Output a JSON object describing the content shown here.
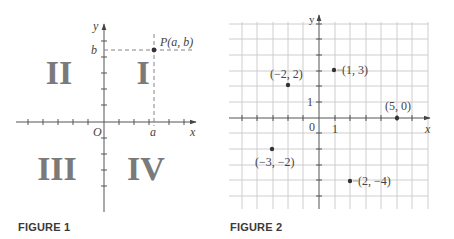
{
  "figures": [
    {
      "caption": "FIGURE 1",
      "axes": {
        "x_label": "x",
        "y_label": "y",
        "origin_label": "O"
      },
      "quadrants": [
        {
          "label": "I"
        },
        {
          "label": "II"
        },
        {
          "label": "III"
        },
        {
          "label": "IV"
        }
      ],
      "point": {
        "label": "P(a, b)",
        "x_label": "a",
        "y_label": "b"
      }
    },
    {
      "caption": "FIGURE 2",
      "axes": {
        "x_label": "x",
        "y_label": "y",
        "origin_label": "0",
        "unit_x_label": "1",
        "unit_y_label": "1"
      },
      "points": [
        {
          "label": "(1, 3)",
          "x": 1,
          "y": 3
        },
        {
          "label": "(−2, 2)",
          "x": -2,
          "y": 2
        },
        {
          "label": "(5, 0)",
          "x": 5,
          "y": 0
        },
        {
          "label": "(−3, −2)",
          "x": -3,
          "y": -2
        },
        {
          "label": "(2, −4)",
          "x": 2,
          "y": -4
        }
      ]
    }
  ],
  "colors": {
    "axis": "#555555",
    "grid": "#c8c8c8",
    "point": "#333333",
    "quadrant_numeral": "#7a7a7a"
  }
}
